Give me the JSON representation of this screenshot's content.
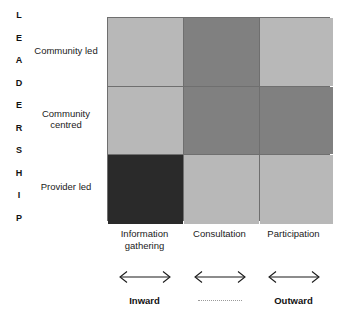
{
  "chart_data": {
    "type": "heatmap",
    "title": "",
    "xlabel": "",
    "ylabel": "LEADERSHIP",
    "categories": [
      "Information gathering",
      "Consultation",
      "Participation"
    ],
    "rows": [
      "Community led",
      "Community centred",
      "Provider led"
    ],
    "legend_position": "none",
    "grid": true,
    "values": [
      [
        1,
        2,
        1
      ],
      [
        1,
        2,
        2
      ],
      [
        3,
        1,
        1
      ]
    ],
    "shade_scale": {
      "1": "#b8b8b8",
      "2": "#808080",
      "3": "#2a2a2a"
    },
    "annotations": [
      "Inward",
      "Outward"
    ]
  },
  "axis": {
    "vertical_label": "LEADERSHIP",
    "letters": [
      "L",
      "E",
      "A",
      "D",
      "E",
      "R",
      "S",
      "H",
      "I",
      "P"
    ]
  },
  "rows": [
    {
      "label": "Community led",
      "cells": [
        {
          "shade": "#b8b8b8"
        },
        {
          "shade": "#808080"
        },
        {
          "shade": "#b8b8b8"
        }
      ]
    },
    {
      "label": "Community centred",
      "cells": [
        {
          "shade": "#b8b8b8"
        },
        {
          "shade": "#808080"
        },
        {
          "shade": "#808080"
        }
      ]
    },
    {
      "label": "Provider led",
      "cells": [
        {
          "shade": "#2a2a2a"
        },
        {
          "shade": "#b8b8b8"
        },
        {
          "shade": "#b8b8b8"
        }
      ]
    }
  ],
  "columns": [
    {
      "label": "Information gathering"
    },
    {
      "label": "Consultation"
    },
    {
      "label": "Participation"
    }
  ],
  "direction": {
    "left_label": "Inward",
    "middle_label": "",
    "right_label": "Outward"
  },
  "caption": "",
  "colors": {
    "light": "#b8b8b8",
    "medium": "#808080",
    "dark": "#2a2a2a",
    "gridline": "#6f6f6f",
    "text": "#1a1a1a"
  }
}
